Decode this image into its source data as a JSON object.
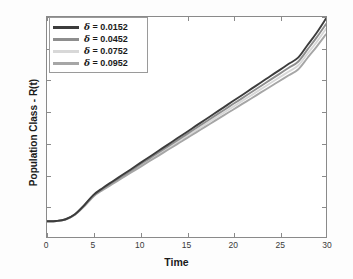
{
  "chart_data": {
    "type": "line",
    "title": "",
    "xlabel": "Time",
    "ylabel": "Population Class - R(t)",
    "xlim": [
      0,
      30
    ],
    "ylim": [
      0.2,
      1.6
    ],
    "xticks": [
      0,
      5,
      10,
      15,
      20,
      25,
      30
    ],
    "xtick_labels": [
      "0",
      "5",
      "10",
      "15",
      "20",
      "25",
      "30"
    ],
    "yticks": [
      0.2,
      0.4,
      0.6,
      0.8,
      1.0,
      1.2,
      1.4,
      1.6
    ],
    "ytick_labels": [
      "0.2",
      "0.4",
      "0.6",
      "0.8",
      "1",
      "1.2",
      "1.4",
      "1.6"
    ],
    "grid": false,
    "legend_position": "top-left-inside",
    "legend_box": true,
    "x": [
      0,
      1,
      2,
      3,
      4,
      5,
      6,
      7,
      8,
      9,
      10,
      11,
      12,
      13,
      14,
      15,
      16,
      17,
      18,
      19,
      20,
      21,
      22,
      23,
      24,
      25,
      26,
      27,
      28,
      29,
      30
    ],
    "series": [
      {
        "name": "δ = 0.0152",
        "label_symbol": "δ",
        "label_value": "= 0.0152",
        "color": "#3c3c3c",
        "values": [
          0.3,
          0.302,
          0.313,
          0.345,
          0.402,
          0.468,
          0.512,
          0.552,
          0.591,
          0.63,
          0.67,
          0.709,
          0.749,
          0.788,
          0.828,
          0.867,
          0.907,
          0.946,
          0.986,
          1.025,
          1.065,
          1.104,
          1.144,
          1.183,
          1.223,
          1.262,
          1.302,
          1.341,
          1.42,
          1.5,
          1.59
        ]
      },
      {
        "name": "δ = 0.0452",
        "label_symbol": "δ",
        "label_value": "= 0.0452",
        "color": "#8e8e8e",
        "values": [
          0.3,
          0.302,
          0.312,
          0.343,
          0.399,
          0.464,
          0.507,
          0.546,
          0.584,
          0.622,
          0.661,
          0.699,
          0.738,
          0.776,
          0.815,
          0.853,
          0.892,
          0.93,
          0.969,
          1.007,
          1.046,
          1.084,
          1.123,
          1.161,
          1.2,
          1.238,
          1.277,
          1.315,
          1.392,
          1.47,
          1.555
        ]
      },
      {
        "name": "δ = 0.0752",
        "label_symbol": "δ",
        "label_value": "= 0.0752",
        "color": "#d8d8d8",
        "values": [
          0.3,
          0.302,
          0.312,
          0.342,
          0.397,
          0.461,
          0.503,
          0.541,
          0.578,
          0.616,
          0.653,
          0.691,
          0.728,
          0.766,
          0.803,
          0.841,
          0.878,
          0.916,
          0.953,
          0.991,
          1.028,
          1.066,
          1.103,
          1.141,
          1.178,
          1.216,
          1.253,
          1.291,
          1.366,
          1.441,
          1.525
        ]
      },
      {
        "name": "δ = 0.0952",
        "label_symbol": "δ",
        "label_value": "= 0.0952",
        "color": "#a6a6a6",
        "values": [
          0.3,
          0.302,
          0.311,
          0.341,
          0.395,
          0.458,
          0.499,
          0.536,
          0.572,
          0.609,
          0.645,
          0.682,
          0.718,
          0.755,
          0.791,
          0.828,
          0.864,
          0.901,
          0.937,
          0.974,
          1.01,
          1.047,
          1.083,
          1.12,
          1.156,
          1.193,
          1.229,
          1.266,
          1.339,
          1.412,
          1.49
        ]
      }
    ]
  },
  "axes": {
    "frame_color": "#8a8a8a"
  }
}
